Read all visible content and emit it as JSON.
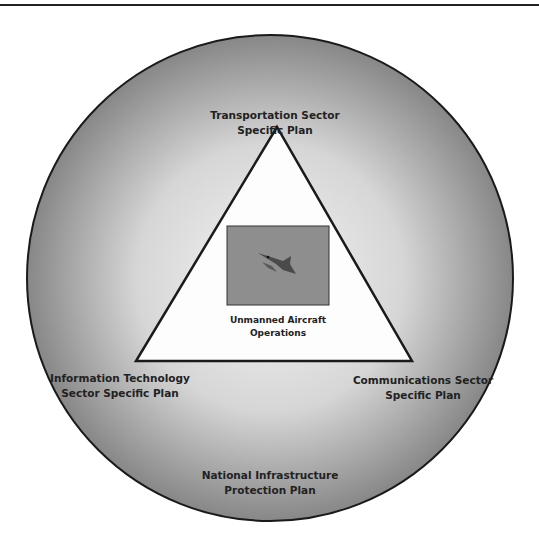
{
  "diagram": {
    "outer_circle": {
      "label_lines": [
        "National Infrastructure",
        "Protection Plan"
      ]
    },
    "triangle": {
      "top": {
        "label_lines": [
          "Transportation Sector",
          "Specific Plan"
        ]
      },
      "bottom_left": {
        "label_lines": [
          "Information Technology",
          "Sector Specific Plan"
        ]
      },
      "bottom_right": {
        "label_lines": [
          "Communications Sector",
          "Specific Plan"
        ]
      }
    },
    "center": {
      "image": "aircraft-photo",
      "label_lines": [
        "Unmanned Aircraft",
        "Operations"
      ]
    }
  },
  "colors": {
    "circle_center": "#f2f2f2",
    "circle_edge": "#8a8a8a",
    "outline": "#1a1a1a",
    "photo_bg": "#8e8e8e"
  }
}
